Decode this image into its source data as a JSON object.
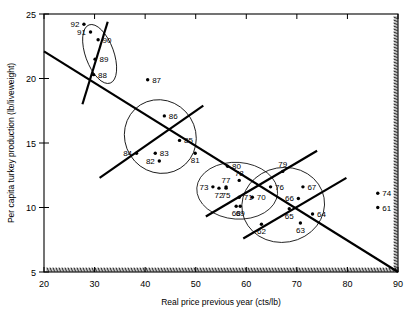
{
  "chart_data": {
    "type": "scatter",
    "title": "",
    "xlabel": "Real price previous year (cts/lb)",
    "ylabel": "Per capita turkey production (lb/liveweight)",
    "xlim": [
      20,
      90
    ],
    "ylim": [
      5,
      25
    ],
    "xticks": [
      20,
      30,
      40,
      50,
      60,
      70,
      80,
      90
    ],
    "yticks": [
      5,
      10,
      15,
      20,
      25
    ],
    "grid": false,
    "legend": "none",
    "points": [
      {
        "label": "92",
        "x": 27.9,
        "y": 24.2,
        "label_side": "left"
      },
      {
        "label": "91",
        "x": 29.2,
        "y": 23.6,
        "label_side": "left"
      },
      {
        "label": "90",
        "x": 30.7,
        "y": 23.0,
        "label_side": "right"
      },
      {
        "label": "89",
        "x": 30.1,
        "y": 21.5,
        "label_side": "right"
      },
      {
        "label": "88",
        "x": 29.8,
        "y": 20.3,
        "label_side": "right"
      },
      {
        "label": "87",
        "x": 40.5,
        "y": 19.9,
        "label_side": "right"
      },
      {
        "label": "86",
        "x": 43.8,
        "y": 17.1,
        "label_side": "right"
      },
      {
        "label": "85",
        "x": 46.8,
        "y": 15.2,
        "label_side": "right"
      },
      {
        "label": "84",
        "x": 38.3,
        "y": 14.2,
        "label_side": "left"
      },
      {
        "label": "83",
        "x": 42.0,
        "y": 14.2,
        "label_side": "right"
      },
      {
        "label": "82",
        "x": 42.8,
        "y": 13.6,
        "label_side": "left"
      },
      {
        "label": "81",
        "x": 49.9,
        "y": 14.2,
        "label_side": "below"
      },
      {
        "label": "80",
        "x": 56.3,
        "y": 13.2,
        "label_side": "right"
      },
      {
        "label": "79",
        "x": 67.2,
        "y": 12.8,
        "label_side": "above"
      },
      {
        "label": "78",
        "x": 58.6,
        "y": 12.1,
        "label_side": "above"
      },
      {
        "label": "77",
        "x": 56.0,
        "y": 11.6,
        "label_side": "above"
      },
      {
        "label": "76",
        "x": 64.8,
        "y": 11.6,
        "label_side": "right"
      },
      {
        "label": "73",
        "x": 53.4,
        "y": 11.6,
        "label_side": "left"
      },
      {
        "label": "72",
        "x": 54.6,
        "y": 11.5,
        "label_side": "below"
      },
      {
        "label": "75",
        "x": 56.0,
        "y": 11.5,
        "label_side": "below"
      },
      {
        "label": "67",
        "x": 71.2,
        "y": 11.6,
        "label_side": "right"
      },
      {
        "label": "71",
        "x": 58.6,
        "y": 10.8,
        "label_side": "right"
      },
      {
        "label": "70",
        "x": 61.2,
        "y": 10.8,
        "label_side": "right"
      },
      {
        "label": "66",
        "x": 70.3,
        "y": 10.7,
        "label_side": "left"
      },
      {
        "label": "74",
        "x": 86.0,
        "y": 11.1,
        "label_side": "right"
      },
      {
        "label": "61",
        "x": 86.0,
        "y": 10.0,
        "label_side": "right"
      },
      {
        "label": "68",
        "x": 58.0,
        "y": 10.1,
        "label_side": "below"
      },
      {
        "label": "69",
        "x": 58.8,
        "y": 10.1,
        "label_side": "below"
      },
      {
        "label": "65",
        "x": 68.5,
        "y": 9.9,
        "label_side": "below"
      },
      {
        "label": "64",
        "x": 73.1,
        "y": 9.5,
        "label_side": "right"
      },
      {
        "label": "63",
        "x": 70.7,
        "y": 8.8,
        "label_side": "below"
      },
      {
        "label": "62",
        "x": 63.0,
        "y": 8.7,
        "label_side": "below"
      }
    ],
    "trend_lines": [
      {
        "name": "overall-negative-trend",
        "x1": 20.0,
        "y1": 22.1,
        "x2": 90.0,
        "y2": 5.0
      },
      {
        "name": "cluster-1-steep-line",
        "x1": 32.6,
        "y1": 24.4,
        "x2": 27.6,
        "y2": 18.0
      },
      {
        "name": "cluster-2-positive-line",
        "x1": 31.0,
        "y1": 12.3,
        "x2": 51.5,
        "y2": 17.9
      },
      {
        "name": "cluster-3-positive-line",
        "x1": 52.0,
        "y1": 9.3,
        "x2": 74.0,
        "y2": 14.4
      },
      {
        "name": "cluster-4-positive-line",
        "x1": 59.4,
        "y1": 7.6,
        "x2": 79.8,
        "y2": 12.3
      }
    ],
    "cluster_outlines": [
      {
        "name": "cluster-1980s-late",
        "cx": 31.0,
        "cy": 21.9,
        "rx": 2.8,
        "ry": 2.4,
        "rotation": -20
      },
      {
        "name": "cluster-1980s-mid",
        "cx": 43.0,
        "cy": 15.5,
        "rx": 7.0,
        "ry": 2.9,
        "rotation": -32
      },
      {
        "name": "cluster-1970s",
        "cx": 58.2,
        "cy": 11.3,
        "rx": 8.0,
        "ry": 2.2,
        "rotation": 4
      },
      {
        "name": "cluster-1960s",
        "cx": 67.3,
        "cy": 10.2,
        "rx": 8.2,
        "ry": 2.9,
        "rotation": -10
      }
    ]
  },
  "axes": {
    "x_title": "Real price previous year (cts/lb)",
    "y_title": "Per capita turkey production (lb/liveweight)",
    "x_tick_labels": [
      "20",
      "30",
      "40",
      "50",
      "60",
      "70",
      "80",
      "90"
    ],
    "y_tick_labels": [
      "5",
      "10",
      "15",
      "20",
      "25"
    ]
  },
  "colors": {
    "foreground": "#000000",
    "background": "#ffffff"
  }
}
